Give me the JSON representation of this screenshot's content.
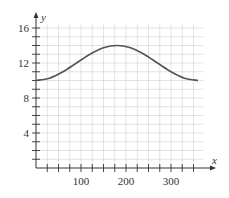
{
  "chart_data": {
    "type": "line",
    "title": "",
    "xlabel": "x",
    "ylabel": "y",
    "xlim": [
      0,
      370
    ],
    "ylim": [
      0,
      16
    ],
    "x_major_ticks": [
      100,
      200,
      300
    ],
    "x_minor_tick_step": 25,
    "y_major_ticks": [
      4,
      8,
      12,
      16
    ],
    "y_minor_tick_step": 1,
    "grid": true,
    "legend": null,
    "series": [
      {
        "name": "curve",
        "color": "#555555",
        "x": [
          0,
          30,
          60,
          90,
          120,
          150,
          180,
          210,
          240,
          270,
          300,
          330,
          360
        ],
        "values": [
          10.0,
          10.27,
          11.0,
          12.0,
          13.0,
          13.73,
          14.0,
          13.73,
          13.0,
          12.0,
          11.0,
          10.27,
          10.0
        ]
      }
    ]
  },
  "labels": {
    "x_axis": "x",
    "y_axis": "y",
    "x_ticks": [
      "100",
      "200",
      "300"
    ],
    "y_ticks": [
      "4",
      "8",
      "12",
      "16"
    ]
  },
  "colors": {
    "grid": "#dcdcdc",
    "axis": "#333333",
    "curve": "#555555"
  }
}
